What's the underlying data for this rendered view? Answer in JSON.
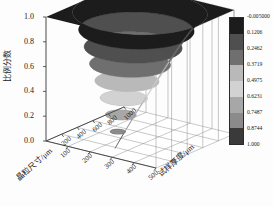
{
  "figure": {
    "background": "#fdfdfd",
    "grid_color": "#8a8a8a",
    "axis_color": "#4a4a4a",
    "text_color": "#1a1a1a"
  },
  "chart_data": {
    "type": "surface",
    "title": "",
    "xlabel": "晶粒尺寸/μm",
    "ylabel": "比例分数",
    "zlabel": "试样厚度/μm",
    "xticks": [
      "100",
      "200",
      "300",
      "400",
      "500"
    ],
    "yticks": [
      "0.0",
      "0.2",
      "0.4",
      "0.6",
      "0.8",
      "1.0"
    ],
    "zticks": [
      "200",
      "400",
      "600",
      "800",
      "1000"
    ],
    "xlim": [
      0,
      500
    ],
    "ylim": [
      0.0,
      1.0
    ],
    "zlim": [
      0,
      1000
    ],
    "grid": true,
    "shape": "inverted-cone-funnel",
    "band_count": 8,
    "band_colors": [
      "#1c1c1c",
      "#4f4f4f",
      "#6f6f6f",
      "#b9b9b9",
      "#d2d2d2",
      "#a7a7a7",
      "#8b8b8b",
      "#3a3a3a"
    ],
    "band_ranges": [
      [
        1.0,
        0.8744
      ],
      [
        0.8744,
        0.7487
      ],
      [
        0.7487,
        0.6231
      ],
      [
        0.6231,
        0.4975
      ],
      [
        0.4975,
        0.3719
      ],
      [
        0.3719,
        0.2462
      ],
      [
        0.2462,
        0.1206
      ],
      [
        0.1206,
        -0.005
      ]
    ],
    "surface_profile": [
      {
        "fraction": 1.0,
        "radius_rel": 1.0
      },
      {
        "fraction": 0.875,
        "radius_rel": 0.855
      },
      {
        "fraction": 0.75,
        "radius_rel": 0.725
      },
      {
        "fraction": 0.625,
        "radius_rel": 0.6
      },
      {
        "fraction": 0.5,
        "radius_rel": 0.475
      },
      {
        "fraction": 0.375,
        "radius_rel": 0.35
      },
      {
        "fraction": 0.25,
        "radius_rel": 0.228
      },
      {
        "fraction": 0.125,
        "radius_rel": 0.112
      },
      {
        "fraction": 0.0,
        "radius_rel": 0.0
      }
    ]
  },
  "colorbar": {
    "orientation": "vertical",
    "position": "right",
    "border_color": "#2a2a2a",
    "ticks": [
      "-0.005000",
      "0.1206",
      "0.2462",
      "0.3719",
      "0.4975",
      "0.6231",
      "0.7487",
      "0.8744",
      "1.000"
    ],
    "swatches": [
      "#1c1c1c",
      "#4f4f4f",
      "#6f6f6f",
      "#b9b9b9",
      "#d2d2d2",
      "#a7a7a7",
      "#8b8b8b",
      "#3a3a3a"
    ]
  }
}
